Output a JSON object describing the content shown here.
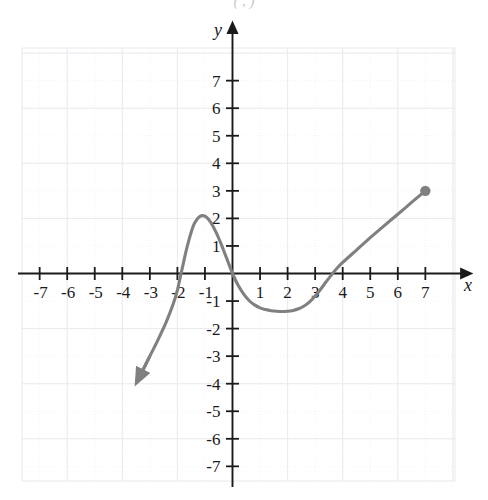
{
  "figure": {
    "title_fragment": "( , )",
    "background_color": "#ffffff",
    "curve_color": "#808080",
    "axis_color": "#1a1a1a",
    "grid_color": "#e8e8ee",
    "minor_grid_color": "#f2f2f6"
  },
  "axes": {
    "x_label": "x",
    "y_label": "y",
    "x_ticks": [
      "-7",
      "-6",
      "-5",
      "-4",
      "-3",
      "-2",
      "-1",
      "1",
      "2",
      "3",
      "4",
      "5",
      "6",
      "7"
    ],
    "y_ticks": [
      "7",
      "6",
      "5",
      "4",
      "3",
      "2",
      "1",
      "-1",
      "-2",
      "-3",
      "-4",
      "-5",
      "-6",
      "-7"
    ]
  },
  "chart_data": {
    "type": "line",
    "title": "",
    "xlabel": "x",
    "ylabel": "y",
    "xlim": [
      -7.7,
      7.7
    ],
    "ylim": [
      -7.7,
      7.7
    ],
    "grid": true,
    "legend": "none",
    "xticks": [
      -7,
      -6,
      -5,
      -4,
      -3,
      -2,
      -1,
      1,
      2,
      3,
      4,
      5,
      6,
      7
    ],
    "yticks": [
      7,
      6,
      5,
      4,
      3,
      2,
      1,
      -1,
      -2,
      -3,
      -4,
      -5,
      -6,
      -7
    ],
    "series": [
      {
        "name": "curve",
        "color": "#808080",
        "start_marker": "arrow",
        "end_marker": "filled-dot",
        "points": [
          [
            -3.3,
            -3.6
          ],
          [
            -3.0,
            -3.0
          ],
          [
            -2.7,
            -2.4
          ],
          [
            -2.4,
            -1.75
          ],
          [
            -2.15,
            -1.1
          ],
          [
            -2.0,
            -0.6
          ],
          [
            -1.9,
            -0.15
          ],
          [
            -1.8,
            0.3
          ],
          [
            -1.7,
            0.75
          ],
          [
            -1.6,
            1.15
          ],
          [
            -1.5,
            1.5
          ],
          [
            -1.4,
            1.78
          ],
          [
            -1.3,
            1.95
          ],
          [
            -1.2,
            2.06
          ],
          [
            -1.1,
            2.1
          ],
          [
            -1.0,
            2.08
          ],
          [
            -0.9,
            2.0
          ],
          [
            -0.8,
            1.87
          ],
          [
            -0.7,
            1.7
          ],
          [
            -0.6,
            1.5
          ],
          [
            -0.5,
            1.28
          ],
          [
            -0.4,
            1.04
          ],
          [
            -0.3,
            0.78
          ],
          [
            -0.2,
            0.52
          ],
          [
            -0.1,
            0.26
          ],
          [
            0.0,
            0.0
          ],
          [
            0.2,
            -0.42
          ],
          [
            0.4,
            -0.74
          ],
          [
            0.6,
            -0.98
          ],
          [
            0.8,
            -1.14
          ],
          [
            1.0,
            -1.25
          ],
          [
            1.2,
            -1.31
          ],
          [
            1.4,
            -1.35
          ],
          [
            1.6,
            -1.37
          ],
          [
            1.8,
            -1.38
          ],
          [
            2.0,
            -1.37
          ],
          [
            2.2,
            -1.34
          ],
          [
            2.4,
            -1.28
          ],
          [
            2.6,
            -1.18
          ],
          [
            2.8,
            -1.03
          ],
          [
            3.0,
            -0.82
          ],
          [
            3.2,
            -0.57
          ],
          [
            3.4,
            -0.3
          ],
          [
            3.6,
            -0.04
          ],
          [
            3.8,
            0.2
          ],
          [
            4.0,
            0.4
          ],
          [
            4.5,
            0.85
          ],
          [
            5.0,
            1.3
          ],
          [
            5.5,
            1.73
          ],
          [
            6.0,
            2.15
          ],
          [
            6.5,
            2.58
          ],
          [
            7.0,
            3.0
          ]
        ],
        "endpoint": [
          7,
          3
        ],
        "arrow_tip": [
          -3.3,
          -3.6
        ]
      }
    ],
    "annotations": [
      {
        "label": "local-maximum",
        "x": -1.1,
        "y": 2.1
      },
      {
        "label": "local-minimum",
        "x": 1.8,
        "y": -1.38
      },
      {
        "label": "x-intercept-left",
        "x": -1.88,
        "y": 0
      },
      {
        "label": "x-intercept-origin",
        "x": 0,
        "y": 0
      },
      {
        "label": "x-intercept-right",
        "x": 3.63,
        "y": 0
      }
    ]
  }
}
